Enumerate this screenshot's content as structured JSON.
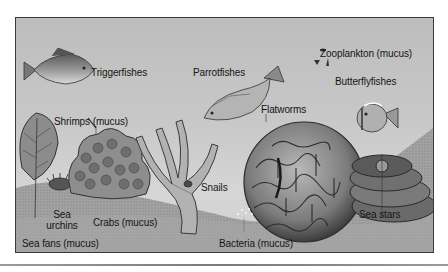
{
  "figure": {
    "colors": {
      "background": "#c4c4c4",
      "seafloor": "#9e9e9e",
      "frame": "#3a3a3a",
      "text": "#151515"
    },
    "labels": {
      "triggerfishes": "Triggerfishes",
      "parrotfishes": "Parrotfishes",
      "zooplankton": "Zooplankton (mucus)",
      "butterflyfishes": "Butterflyfishes",
      "shrimps": "Shrimps (mucus)",
      "flatworms": "Flatworms",
      "snails": "Snails",
      "sea_urchins": "Sea urchins",
      "crabs": "Crabs (mucus)",
      "sea_stars": "Sea stars",
      "bacteria": "Bacteria (mucus)",
      "sea_fans": "Sea fans (mucus)"
    },
    "icons": [
      "triggerfish-icon",
      "parrotfish-icon",
      "zooplankton-icon",
      "butterflyfish-icon",
      "sea-fan-icon",
      "sea-urchin-icon",
      "coral-cluster-icon",
      "branching-coral-icon",
      "brain-coral-icon",
      "plate-coral-icon"
    ]
  }
}
